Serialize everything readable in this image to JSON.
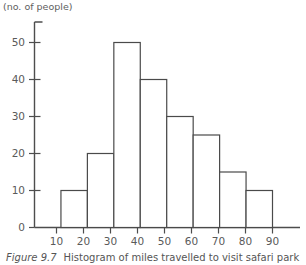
{
  "figure": {
    "caption_number": "Figure 9.7",
    "caption_text": "Histogram of miles travelled to visit safari park"
  },
  "chart_data": {
    "type": "bar",
    "title": "",
    "subtitle": "",
    "xlabel": "Miles",
    "ylabel": "(no. of people)",
    "categories": [
      "10-20",
      "20-30",
      "30-40",
      "40-50",
      "50-60",
      "60-70",
      "70-80",
      "80-90"
    ],
    "bin_edges": [
      10,
      20,
      30,
      40,
      50,
      60,
      70,
      80,
      90
    ],
    "values": [
      10,
      20,
      50,
      40,
      30,
      25,
      15,
      10
    ],
    "xlim": [
      0,
      90
    ],
    "ylim": [
      0,
      55
    ],
    "xticks": [
      10,
      20,
      30,
      40,
      50,
      60,
      70,
      80,
      90
    ],
    "xtick_labels": [
      "10",
      "20",
      "30",
      "40",
      "50",
      "60",
      "70",
      "80",
      "90"
    ],
    "yticks": [
      0,
      10,
      20,
      30,
      40,
      50
    ],
    "ytick_labels": [
      "0",
      "10",
      "20",
      "30",
      "40",
      "50"
    ],
    "grid": false,
    "legend": false,
    "legend_position": "none",
    "bar_fill": "#ffffff",
    "bar_stroke": "#4a4a4a",
    "axis_color": "#4d4d4d"
  }
}
